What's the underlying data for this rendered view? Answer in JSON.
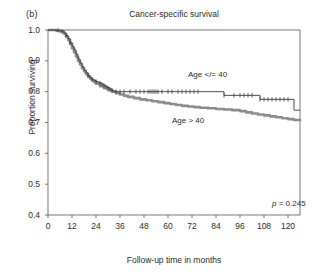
{
  "panel": {
    "label": "(b)"
  },
  "chart_data": {
    "type": "line",
    "title": "Cancer-specific survival",
    "xlabel": "Follow-up time in months",
    "ylabel": "Proportion surviving",
    "xlim": [
      0,
      126
    ],
    "ylim": [
      0.4,
      1.0
    ],
    "xticks": [
      0,
      12,
      24,
      36,
      48,
      60,
      72,
      84,
      96,
      108,
      120
    ],
    "yticks": [
      "1.0",
      "0.9",
      "0.8",
      "0.7",
      "0.6",
      "0.5",
      "0.4"
    ],
    "ytick_values": [
      1.0,
      0.9,
      0.8,
      0.7,
      0.6,
      0.5,
      0.4
    ],
    "grid": false,
    "legend_position": "inline-annotation",
    "annotations": [
      {
        "name": "p-value",
        "text_prefix": "p",
        "text_body": " = 0.245",
        "x": 112,
        "y": 0.435
      }
    ],
    "colors": {
      "age_le_40": "#3a3a3a",
      "age_gt_40": "#8c8c8c",
      "axis": "#555555"
    },
    "series": [
      {
        "name": "Age </= 40",
        "label": "Age </= 40",
        "color": "#3a3a3a",
        "style": "step-thin-with-censor-marks",
        "label_x": 70,
        "label_y": 0.855,
        "x": [
          0,
          2,
          4,
          6,
          8,
          9,
          10,
          11,
          12,
          13,
          14,
          15,
          16,
          17,
          18,
          19,
          20,
          21,
          22,
          23,
          24,
          25,
          26,
          27,
          28,
          29,
          30,
          31,
          32,
          33,
          35,
          40,
          50,
          60,
          70,
          80,
          86,
          88,
          92,
          96,
          100,
          103,
          106,
          109,
          112,
          116,
          120,
          123,
          126
        ],
        "y": [
          1.0,
          1.0,
          0.999,
          0.997,
          0.99,
          0.982,
          0.972,
          0.96,
          0.947,
          0.935,
          0.921,
          0.906,
          0.893,
          0.881,
          0.87,
          0.861,
          0.852,
          0.845,
          0.84,
          0.836,
          0.833,
          0.83,
          0.827,
          0.824,
          0.82,
          0.816,
          0.812,
          0.808,
          0.804,
          0.8,
          0.8,
          0.8,
          0.8,
          0.8,
          0.8,
          0.8,
          0.8,
          0.788,
          0.788,
          0.788,
          0.788,
          0.788,
          0.775,
          0.775,
          0.775,
          0.775,
          0.775,
          0.74,
          0.74
        ],
        "censor_x": [
          5,
          7,
          9,
          11,
          20,
          22,
          24,
          26,
          27,
          28,
          29,
          30,
          31,
          32,
          34,
          36,
          38,
          41,
          44,
          46,
          48,
          50,
          51,
          52,
          53,
          54,
          55,
          57,
          60,
          62,
          65,
          67,
          69,
          71,
          73,
          75,
          88,
          93,
          96,
          98,
          100,
          102,
          106,
          108,
          110,
          112,
          114,
          116,
          118,
          120
        ],
        "censor_y": [
          0.999,
          0.995,
          0.982,
          0.96,
          0.852,
          0.84,
          0.833,
          0.827,
          0.824,
          0.82,
          0.816,
          0.812,
          0.808,
          0.804,
          0.8,
          0.8,
          0.8,
          0.8,
          0.8,
          0.8,
          0.8,
          0.8,
          0.8,
          0.8,
          0.8,
          0.8,
          0.8,
          0.8,
          0.8,
          0.8,
          0.8,
          0.8,
          0.8,
          0.8,
          0.8,
          0.8,
          0.788,
          0.788,
          0.788,
          0.788,
          0.788,
          0.788,
          0.775,
          0.775,
          0.775,
          0.775,
          0.775,
          0.775,
          0.775,
          0.775
        ]
      },
      {
        "name": "Age > 40",
        "label": "Age > 40",
        "color": "#8c8c8c",
        "style": "step-thick",
        "label_x": 62,
        "label_y": 0.705,
        "x": [
          0,
          2,
          4,
          6,
          8,
          9,
          10,
          11,
          12,
          13,
          14,
          15,
          16,
          17,
          18,
          19,
          20,
          21,
          22,
          23,
          24,
          26,
          28,
          30,
          32,
          34,
          36,
          38,
          40,
          43,
          46,
          49,
          52,
          55,
          58,
          61,
          64,
          67,
          70,
          73,
          76,
          80,
          84,
          88,
          92,
          96,
          99,
          102,
          105,
          108,
          111,
          114,
          117,
          120,
          123,
          126
        ],
        "y": [
          1.0,
          1.0,
          0.998,
          0.995,
          0.988,
          0.979,
          0.968,
          0.955,
          0.941,
          0.928,
          0.914,
          0.9,
          0.888,
          0.876,
          0.866,
          0.857,
          0.849,
          0.842,
          0.836,
          0.831,
          0.826,
          0.818,
          0.811,
          0.805,
          0.8,
          0.795,
          0.791,
          0.787,
          0.783,
          0.779,
          0.775,
          0.772,
          0.769,
          0.766,
          0.763,
          0.76,
          0.757,
          0.754,
          0.752,
          0.75,
          0.748,
          0.746,
          0.744,
          0.742,
          0.74,
          0.737,
          0.733,
          0.729,
          0.726,
          0.723,
          0.72,
          0.717,
          0.714,
          0.711,
          0.708,
          0.705
        ]
      }
    ]
  }
}
